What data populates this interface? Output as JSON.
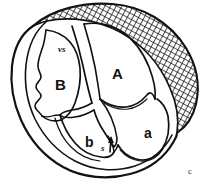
{
  "figure": {
    "panel_label": "c",
    "caption_text": "",
    "background_color": "#ffffff",
    "ink_color": "#111111",
    "width_px": 205,
    "height_px": 186,
    "style": "black-and-white anatomical line drawing with cross-hatched wall band"
  },
  "labels": [
    {
      "id": "chamber-A",
      "text": "A",
      "x": 112,
      "y": 66,
      "size": "large"
    },
    {
      "id": "chamber-B",
      "text": "B",
      "x": 55,
      "y": 77,
      "size": "large"
    },
    {
      "id": "chamber-a",
      "text": "a",
      "x": 144,
      "y": 126,
      "size": "medium"
    },
    {
      "id": "chamber-b",
      "text": "b",
      "x": 85,
      "y": 135,
      "size": "medium"
    },
    {
      "id": "septum-vs",
      "text": "vs",
      "x": 58,
      "y": 45,
      "size": "small"
    },
    {
      "id": "structure-s",
      "text": "s",
      "x": 101,
      "y": 144,
      "size": "small"
    },
    {
      "id": "panel-c",
      "text": "c",
      "x": 188,
      "y": 167,
      "size": "small"
    }
  ],
  "annotations": {
    "arrow_s": {
      "name": "s-pointer-arrow",
      "from_x": 110,
      "from_y": 152,
      "to_x": 112,
      "to_y": 136,
      "description": "short arrow pointing up from label s"
    }
  },
  "regions": [
    {
      "name": "outer-wall-outline",
      "description": "closed ovoid outer contour of the sectioned organ"
    },
    {
      "name": "hatched-myocardium-band",
      "description": "cross-hatched thick band along upper and right periphery"
    },
    {
      "name": "chamber-A-cavity",
      "description": "upper right large cavity labelled A"
    },
    {
      "name": "chamber-B-cavity",
      "description": "upper left cavity labelled B with trabeculated inner wall"
    },
    {
      "name": "chamber-a-cavity",
      "description": "lower right cavity labelled a"
    },
    {
      "name": "chamber-b-cavity",
      "description": "lower middle cavity labelled b"
    },
    {
      "name": "ventricular-septum",
      "description": "central dividing wall between A/B, labelled vs"
    },
    {
      "name": "valve-structure",
      "description": "central branching valve-like structure between upper and lower cavities"
    }
  ]
}
